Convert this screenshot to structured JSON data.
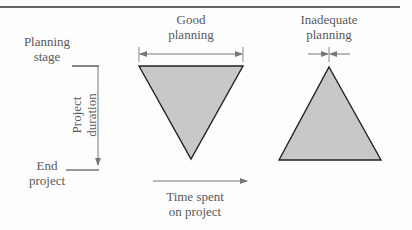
{
  "diagram": {
    "labels": {
      "planning_stage": [
        "Planning",
        "stage"
      ],
      "end_project": [
        "End",
        "project"
      ],
      "project_duration": [
        "Project",
        "duration"
      ],
      "time_spent": [
        "Time spent",
        "on project"
      ],
      "good_planning": [
        "Good",
        "planning"
      ],
      "inadequate_planning": [
        "Inadequate",
        "planning"
      ]
    },
    "shapes": {
      "good_planning_triangle": "inverted triangle (wide at planning stage, narrow at end)",
      "inadequate_planning_triangle": "upright triangle (narrow at planning stage, wide at end)"
    },
    "colors": {
      "fill": "#c8c8c8",
      "stroke": "#222222",
      "arrow": "#777777",
      "text": "#5a5a5a"
    }
  }
}
